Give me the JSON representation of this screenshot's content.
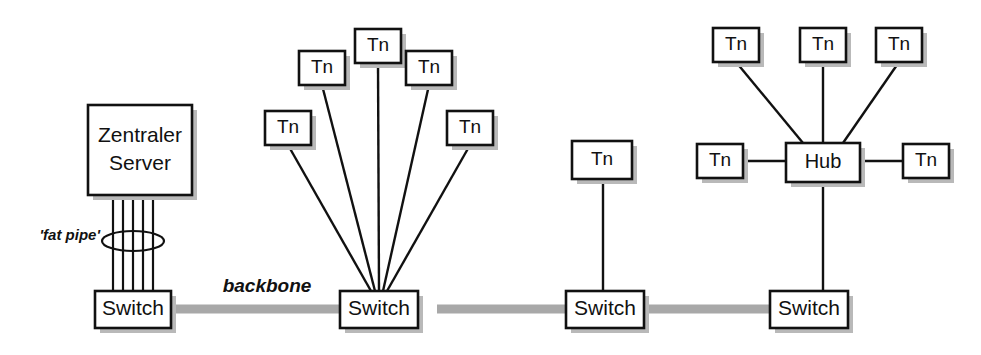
{
  "diagram": {
    "type": "network-topology",
    "canvas": {
      "width": 981,
      "height": 355
    },
    "colors": {
      "background": "#ffffff",
      "stroke": "#111111",
      "shadow": "#b9b9b9",
      "backbone": "#a8a8a8"
    },
    "annotations": [
      {
        "id": "fat-pipe",
        "text": "'fat pipe'",
        "x": 100,
        "y": 240,
        "style": "italic-bold"
      },
      {
        "id": "backbone",
        "text": "backbone",
        "x": 267,
        "y": 292,
        "style": "italic-bold"
      }
    ],
    "backbone_segments": [
      {
        "from": "switch-1",
        "to": "switch-2",
        "x1": 170,
        "y1": 309,
        "x2": 341,
        "y2": 309
      },
      {
        "from": "switch-2",
        "to": "switch-3",
        "x1": 437,
        "y1": 309,
        "x2": 567,
        "y2": 309
      },
      {
        "from": "switch-3",
        "to": "switch-4",
        "x1": 643,
        "y1": 309,
        "x2": 771,
        "y2": 309
      }
    ],
    "fat_pipe": {
      "label": "'fat pipe'",
      "line_count": 5,
      "lines_x": [
        113,
        123,
        133,
        143,
        153
      ],
      "y_top": 195,
      "y_bottom": 292,
      "ellipse": {
        "cx": 133,
        "cy": 241,
        "rx": 31,
        "ry": 10
      }
    },
    "nodes": [
      {
        "id": "server-1",
        "label": "Zentraler Server",
        "label_lines": [
          "Zentraler",
          "Server"
        ],
        "kind": "server",
        "x": 88,
        "y": 105,
        "w": 104,
        "h": 90
      },
      {
        "id": "switch-1",
        "label": "Switch",
        "kind": "switch",
        "x": 95,
        "y": 291,
        "w": 76,
        "h": 37
      },
      {
        "id": "switch-2",
        "label": "Switch",
        "kind": "switch",
        "x": 340,
        "y": 291,
        "w": 78,
        "h": 37
      },
      {
        "id": "switch-3",
        "label": "Switch",
        "kind": "switch",
        "x": 566,
        "y": 291,
        "w": 78,
        "h": 37
      },
      {
        "id": "switch-4",
        "label": "Switch",
        "kind": "switch",
        "x": 770,
        "y": 291,
        "w": 78,
        "h": 37
      },
      {
        "id": "hub-1",
        "label": "Hub",
        "kind": "hub",
        "x": 786,
        "y": 143,
        "w": 74,
        "h": 39
      },
      {
        "id": "tn-s2-a",
        "label": "Tn",
        "kind": "terminal",
        "x": 265,
        "y": 111,
        "w": 46,
        "h": 34
      },
      {
        "id": "tn-s2-b",
        "label": "Tn",
        "kind": "terminal",
        "x": 299,
        "y": 51,
        "w": 46,
        "h": 34
      },
      {
        "id": "tn-s2-c",
        "label": "Tn",
        "kind": "terminal",
        "x": 355,
        "y": 29,
        "w": 46,
        "h": 34
      },
      {
        "id": "tn-s2-d",
        "label": "Tn",
        "kind": "terminal",
        "x": 406,
        "y": 51,
        "w": 46,
        "h": 34
      },
      {
        "id": "tn-s2-e",
        "label": "Tn",
        "kind": "terminal",
        "x": 447,
        "y": 111,
        "w": 46,
        "h": 34
      },
      {
        "id": "tn-s3-a",
        "label": "Tn",
        "kind": "terminal",
        "x": 572,
        "y": 141,
        "w": 60,
        "h": 38
      },
      {
        "id": "tn-h-nw",
        "label": "Tn",
        "kind": "terminal",
        "x": 713,
        "y": 28,
        "w": 46,
        "h": 34
      },
      {
        "id": "tn-h-n",
        "label": "Tn",
        "kind": "terminal",
        "x": 800,
        "y": 28,
        "w": 46,
        "h": 34
      },
      {
        "id": "tn-h-ne",
        "label": "Tn",
        "kind": "terminal",
        "x": 876,
        "y": 28,
        "w": 46,
        "h": 34
      },
      {
        "id": "tn-h-w",
        "label": "Tn",
        "kind": "terminal",
        "x": 697,
        "y": 144,
        "w": 46,
        "h": 34
      },
      {
        "id": "tn-h-e",
        "label": "Tn",
        "kind": "terminal",
        "x": 903,
        "y": 144,
        "w": 46,
        "h": 34
      }
    ],
    "links": [
      {
        "from": "tn-s2-a",
        "to": "switch-2",
        "x1": 288,
        "y1": 145,
        "x2": 371,
        "y2": 291
      },
      {
        "from": "tn-s2-b",
        "to": "switch-2",
        "x1": 322,
        "y1": 85,
        "x2": 375,
        "y2": 291
      },
      {
        "from": "tn-s2-c",
        "to": "switch-2",
        "x1": 378,
        "y1": 63,
        "x2": 379,
        "y2": 291
      },
      {
        "from": "tn-s2-d",
        "to": "switch-2",
        "x1": 429,
        "y1": 85,
        "x2": 383,
        "y2": 291
      },
      {
        "from": "tn-s2-e",
        "to": "switch-2",
        "x1": 470,
        "y1": 145,
        "x2": 387,
        "y2": 291
      },
      {
        "from": "tn-s3-a",
        "to": "switch-3",
        "x1": 603,
        "y1": 179,
        "x2": 603,
        "y2": 291
      },
      {
        "from": "tn-h-nw",
        "to": "hub-1",
        "x1": 736,
        "y1": 62,
        "x2": 803,
        "y2": 143
      },
      {
        "from": "tn-h-n",
        "to": "hub-1",
        "x1": 823,
        "y1": 62,
        "x2": 823,
        "y2": 143
      },
      {
        "from": "tn-h-ne",
        "to": "hub-1",
        "x1": 899,
        "y1": 62,
        "x2": 843,
        "y2": 143
      },
      {
        "from": "tn-h-w",
        "to": "hub-1",
        "x1": 743,
        "y1": 161,
        "x2": 786,
        "y2": 161
      },
      {
        "from": "tn-h-e",
        "to": "hub-1",
        "x1": 860,
        "y1": 161,
        "x2": 903,
        "y2": 161
      },
      {
        "from": "hub-1",
        "to": "switch-4",
        "x1": 823,
        "y1": 182,
        "x2": 823,
        "y2": 291
      }
    ]
  }
}
